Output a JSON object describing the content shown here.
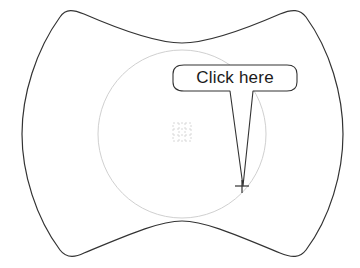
{
  "canvas": {
    "width": 360,
    "height": 268,
    "background": "#ffffff"
  },
  "outer_shape": {
    "description": "concave rounded rectangle (barrel/pillow shape) outline",
    "stroke": "#333333"
  },
  "target_circle": {
    "cx": 182,
    "cy": 134,
    "r": 84,
    "stroke": "#d0d0d0"
  },
  "center_grid_icon": {
    "icon": "dotted-grid-icon",
    "color": "#d8d8d8"
  },
  "callout": {
    "label": "Click here",
    "stroke": "#333333",
    "fill": "#ffffff"
  },
  "crosshair": {
    "icon": "crosshair-icon",
    "x": 242,
    "y": 186,
    "color": "#333333"
  }
}
